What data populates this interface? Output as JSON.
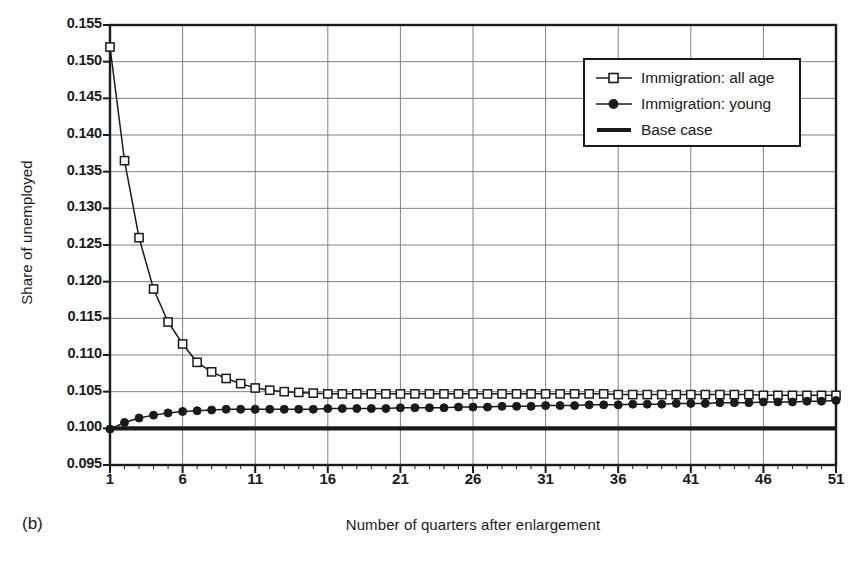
{
  "figure": {
    "panel_caption": "(b)",
    "xlabel": "Number of quarters after enlargement",
    "ylabel": "Share of unemployed"
  },
  "legend": {
    "position": "top-right-inside",
    "entries": [
      {
        "label": "Immigration: all age",
        "marker": "open-square",
        "color": "#1a1a1a"
      },
      {
        "label": "Immigration: young",
        "marker": "filled-circle",
        "color": "#1a1a1a"
      },
      {
        "label": "Base case",
        "marker": "thick-line",
        "color": "#1a1a1a"
      }
    ]
  },
  "chart_data": {
    "type": "line",
    "title": "",
    "subtitle": "",
    "xlabel": "Number of quarters after enlargement",
    "ylabel": "Share of unemployed",
    "xlim": [
      1,
      51
    ],
    "ylim": [
      0.095,
      0.155
    ],
    "xticks": [
      1,
      6,
      11,
      16,
      21,
      26,
      31,
      36,
      41,
      46,
      51
    ],
    "xtick_labels": [
      "1",
      "6",
      "11",
      "16",
      "21",
      "26",
      "31",
      "36",
      "41",
      "46",
      "51"
    ],
    "yticks": [
      0.095,
      0.1,
      0.105,
      0.11,
      0.115,
      0.12,
      0.125,
      0.13,
      0.135,
      0.14,
      0.145,
      0.15,
      0.155
    ],
    "ytick_labels": [
      "0.095",
      "0.100",
      "0.105",
      "0.110",
      "0.115",
      "0.120",
      "0.125",
      "0.130",
      "0.135",
      "0.140",
      "0.145",
      "0.150",
      "0.155"
    ],
    "grid": true,
    "grid_color": "#808080",
    "axis_color": "#1a1a1a",
    "legend_position": "upper right",
    "x": [
      1,
      2,
      3,
      4,
      5,
      6,
      7,
      8,
      9,
      10,
      11,
      12,
      13,
      14,
      15,
      16,
      17,
      18,
      19,
      20,
      21,
      22,
      23,
      24,
      25,
      26,
      27,
      28,
      29,
      30,
      31,
      32,
      33,
      34,
      35,
      36,
      37,
      38,
      39,
      40,
      41,
      42,
      43,
      44,
      45,
      46,
      47,
      48,
      49,
      50,
      51
    ],
    "series": [
      {
        "name": "Immigration: all age",
        "marker": "open-square",
        "values": [
          0.152,
          0.1365,
          0.126,
          0.119,
          0.1145,
          0.1115,
          0.109,
          0.1077,
          0.1068,
          0.1061,
          0.1055,
          0.1052,
          0.105,
          0.1049,
          0.1048,
          0.1047,
          0.1047,
          0.1047,
          0.1047,
          0.1047,
          0.1047,
          0.1047,
          0.1047,
          0.1047,
          0.1047,
          0.1047,
          0.1047,
          0.1047,
          0.1047,
          0.1047,
          0.1047,
          0.1047,
          0.1047,
          0.1047,
          0.1047,
          0.1046,
          0.1046,
          0.1046,
          0.1046,
          0.1046,
          0.1046,
          0.1046,
          0.1046,
          0.1046,
          0.1046,
          0.1045,
          0.1045,
          0.1045,
          0.1045,
          0.1045,
          0.1045
        ]
      },
      {
        "name": "Immigration: young",
        "marker": "filled-circle",
        "values": [
          0.0999,
          0.1008,
          0.1014,
          0.1018,
          0.1021,
          0.1023,
          0.1024,
          0.1025,
          0.1026,
          0.1026,
          0.1026,
          0.1026,
          0.1026,
          0.1026,
          0.1026,
          0.1027,
          0.1027,
          0.1027,
          0.1027,
          0.1027,
          0.1028,
          0.1028,
          0.1028,
          0.1028,
          0.1029,
          0.1029,
          0.1029,
          0.103,
          0.103,
          0.103,
          0.1031,
          0.1031,
          0.1031,
          0.1032,
          0.1032,
          0.1032,
          0.1033,
          0.1033,
          0.1033,
          0.1034,
          0.1034,
          0.1034,
          0.1035,
          0.1035,
          0.1035,
          0.1036,
          0.1036,
          0.1036,
          0.1037,
          0.1037,
          0.1038
        ]
      },
      {
        "name": "Base case",
        "marker": "thick-line",
        "values": [
          0.1,
          0.1,
          0.1,
          0.1,
          0.1,
          0.1,
          0.1,
          0.1,
          0.1,
          0.1,
          0.1,
          0.1,
          0.1,
          0.1,
          0.1,
          0.1,
          0.1,
          0.1,
          0.1,
          0.1,
          0.1,
          0.1,
          0.1,
          0.1,
          0.1,
          0.1,
          0.1,
          0.1,
          0.1,
          0.1,
          0.1,
          0.1,
          0.1,
          0.1,
          0.1,
          0.1,
          0.1,
          0.1,
          0.1,
          0.1,
          0.1,
          0.1,
          0.1,
          0.1,
          0.1,
          0.1,
          0.1,
          0.1,
          0.1,
          0.1,
          0.1
        ]
      }
    ]
  }
}
